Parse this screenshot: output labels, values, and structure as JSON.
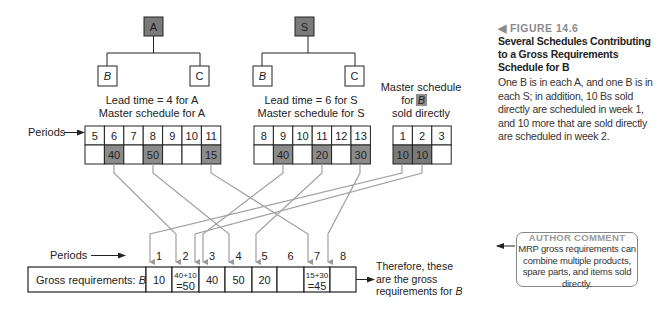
{
  "figure": {
    "label": "◀ FIGURE 14.6",
    "title": "Several Schedules Contributing to a Gross Requirements Schedule for B",
    "description": "One B is in each A, and one B is in each S; in addition, 10 Bs sold directly are scheduled in week 1, and 10 more that are sold directly are scheduled in week 2."
  },
  "author_comment": {
    "heading": "AUTHOR COMMENT",
    "text": "MRP gross requirements can combine multiple products, spare parts, and items sold directly."
  },
  "product_structures": [
    {
      "parent": "A",
      "children": [
        "B",
        "C"
      ],
      "lead_time_label": "Lead time = 4 for A",
      "schedule_label": "Master schedule for A"
    },
    {
      "parent": "S",
      "children": [
        "B",
        "C"
      ],
      "lead_time_label": "Lead time = 6 for S",
      "schedule_label": "Master schedule for S"
    }
  ],
  "direct_sales": {
    "label_line1": "Master schedule",
    "label_for": "for",
    "label_item": "B",
    "label_line3": "sold directly"
  },
  "master_schedules": {
    "periods_label": "Periods",
    "A": {
      "periods": [
        "5",
        "6",
        "7",
        "8",
        "9",
        "10",
        "11"
      ],
      "quantities": [
        "",
        "40",
        "",
        "50",
        "",
        "",
        "15"
      ]
    },
    "S": {
      "periods": [
        "8",
        "9",
        "10",
        "11",
        "12",
        "13"
      ],
      "quantities": [
        "",
        "40",
        "",
        "20",
        "",
        "30"
      ]
    },
    "B_direct": {
      "periods": [
        "1",
        "2",
        "3"
      ],
      "quantities": [
        "10",
        "10",
        ""
      ]
    }
  },
  "gross_requirements": {
    "periods_label": "Periods",
    "row_label": "Gross requirements:",
    "row_item": "B",
    "periods": [
      "1",
      "2",
      "3",
      "4",
      "5",
      "6",
      "7",
      "8"
    ],
    "values": [
      "10",
      "40+10\n=50",
      "40",
      "50",
      "20",
      "",
      "15+30\n=45",
      ""
    ],
    "value_lines": [
      [
        "10"
      ],
      [
        "40+10",
        "=50"
      ],
      [
        "40"
      ],
      [
        "50"
      ],
      [
        "20"
      ],
      [
        ""
      ],
      [
        "15+30",
        "=45"
      ],
      [
        ""
      ]
    ],
    "note_lines": [
      "Therefore, these",
      "are the gross",
      "requirements for B"
    ]
  },
  "colors": {
    "shaded_cell": "#8c8c8c",
    "parent_box": "#7a7a7a",
    "arrow_line": "#a0a0a0",
    "border": "#222222"
  }
}
